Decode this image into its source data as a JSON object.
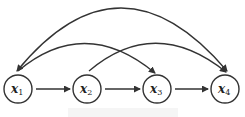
{
  "diagram": {
    "type": "directed-graph",
    "stroke_color": "#333333",
    "nodes": [
      {
        "id": "x1",
        "var": "x",
        "sub": "1",
        "cx": 18,
        "cy": 89
      },
      {
        "id": "x2",
        "var": "x",
        "sub": "2",
        "cx": 87,
        "cy": 89
      },
      {
        "id": "x3",
        "var": "x",
        "sub": "3",
        "cx": 157,
        "cy": 89
      },
      {
        "id": "x4",
        "var": "x",
        "sub": "4",
        "cx": 225,
        "cy": 89
      }
    ],
    "edges": [
      {
        "from": "x1",
        "to": "x2",
        "style": "straight"
      },
      {
        "from": "x2",
        "to": "x3",
        "style": "straight"
      },
      {
        "from": "x3",
        "to": "x4",
        "style": "straight"
      },
      {
        "from": "x1",
        "to": "x3",
        "style": "arc"
      },
      {
        "from": "x2",
        "to": "x4",
        "style": "arc"
      },
      {
        "from": "x1",
        "to": "x4",
        "style": "arc",
        "bidirectional": true
      }
    ]
  }
}
